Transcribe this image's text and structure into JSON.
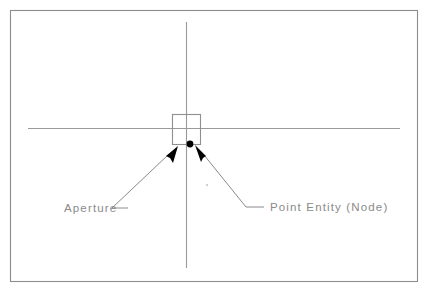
{
  "figure": {
    "name": "cad-aperture-node-diagram",
    "width": 428,
    "height": 296,
    "background_color": "#ffffff",
    "border_color": "#8c8c8c"
  },
  "labels": {
    "aperture": "Aperture",
    "point_entity": "Point Entity (Node)"
  },
  "elements": {
    "crosshair": {
      "name": "crosshair-cursor",
      "color": "#9a9a9a",
      "center_x": 186,
      "center_y": 129,
      "horizontal_start_x": 28,
      "horizontal_end_x": 400,
      "vertical_start_y": 22,
      "vertical_end_y": 268
    },
    "aperture_box": {
      "name": "aperture-box",
      "color": "#8f8f8f",
      "x": 172,
      "y": 114,
      "width": 29,
      "height": 31
    },
    "node_point": {
      "name": "point-entity-node",
      "color": "#000000",
      "center_x": 190,
      "center_y": 144,
      "radius": 3.4
    }
  },
  "leaders": {
    "aperture_leader": {
      "name": "aperture-leader-line",
      "color": "#8a8a8a",
      "tip_x": 166,
      "tip_y": 157,
      "elbow_x": 112,
      "elbow_y": 208,
      "end_x": 128,
      "end_y": 208
    },
    "point_leader": {
      "name": "point-entity-leader-line",
      "color": "#8a8a8a",
      "tip_x": 206,
      "tip_y": 157,
      "elbow_x": 246,
      "elbow_y": 207,
      "end_x": 264,
      "end_y": 207
    }
  },
  "text_positions": {
    "aperture_x": 64,
    "aperture_y": 212,
    "point_entity_x": 270,
    "point_entity_y": 211
  }
}
